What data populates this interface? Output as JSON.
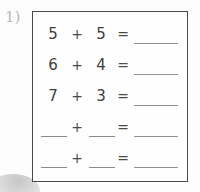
{
  "document": {
    "type": "math-worksheet-problem-box",
    "item_number": "1)",
    "blank_placeholder": ""
  },
  "colors": {
    "box_border": "#4a4a4a",
    "text": "#3e3e3e",
    "rule_line": "#8a8a8a",
    "page_background": "#fdfdfd",
    "item_number": "#b9b9b9"
  },
  "symbols": {
    "plus": "+",
    "equals": "="
  },
  "rows": [
    {
      "left": "5",
      "operator": "+",
      "right": "5",
      "equals": "=",
      "answer": "",
      "left_blank": false,
      "right_blank": false,
      "answer_blank": true
    },
    {
      "left": "6",
      "operator": "+",
      "right": "4",
      "equals": "=",
      "answer": "",
      "left_blank": false,
      "right_blank": false,
      "answer_blank": true
    },
    {
      "left": "7",
      "operator": "+",
      "right": "3",
      "equals": "=",
      "answer": "",
      "left_blank": false,
      "right_blank": false,
      "answer_blank": true
    },
    {
      "left": "",
      "operator": "+",
      "right": "",
      "equals": "=",
      "answer": "",
      "left_blank": true,
      "right_blank": true,
      "answer_blank": true
    },
    {
      "left": "",
      "operator": "+",
      "right": "",
      "equals": "=",
      "answer": "",
      "left_blank": true,
      "right_blank": true,
      "answer_blank": true
    }
  ]
}
